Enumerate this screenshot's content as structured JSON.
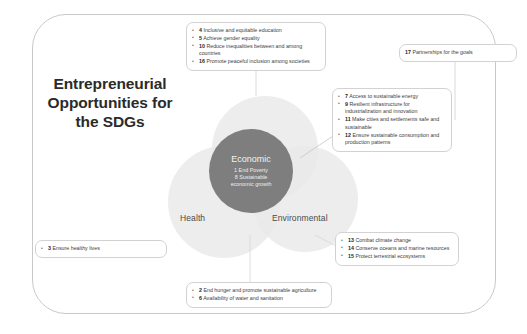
{
  "title": "Entrepreneurial Opportunities for the SDGs",
  "colors": {
    "core_circle": "#7e7e7e",
    "venn_circle": "#e9e9e9",
    "frame_border": "#c9c9c9",
    "callout_border": "#d2d2d2",
    "title_text": "#2b2b2b"
  },
  "venn": {
    "social_label": "Social",
    "health_label": "Health",
    "environmental_label": "Environmental",
    "core": {
      "title": "Economic",
      "line1": "1 End Poverty",
      "line2": "8 Sustainable",
      "line3": "economic growth"
    }
  },
  "callouts": {
    "social": [
      {
        "num": "4",
        "text": "Inclusive and equitable education"
      },
      {
        "num": "5",
        "text": "Achieve gender equality"
      },
      {
        "num": "10",
        "text": "Reduce inequalities between and among countries"
      },
      {
        "num": "16",
        "text": "Promote peaceful inclusion among societies"
      }
    ],
    "partnerships": [
      {
        "num": "17",
        "text": "Partnerships for the goals"
      }
    ],
    "economic_right": [
      {
        "num": "7",
        "text": "Access to sustainable energy"
      },
      {
        "num": "9",
        "text": "Resilient infrastructure for industrialization and innovation"
      },
      {
        "num": "11",
        "text": "Make cities and settlements safe and sustainable"
      },
      {
        "num": "12",
        "text": "Ensure sustainable consumption and production patterns"
      }
    ],
    "environmental": [
      {
        "num": "13",
        "text": "Combat climate change"
      },
      {
        "num": "14",
        "text": "Conserve oceans and marine resources"
      },
      {
        "num": "15",
        "text": "Protect terrestrial ecosystems"
      }
    ],
    "bottom": [
      {
        "num": "2",
        "text": "End hunger and promote sustainable agriculture"
      },
      {
        "num": "6",
        "text": "Availability of water and sanitation"
      }
    ],
    "health": [
      {
        "num": "3",
        "text": "Ensure healthy lives"
      }
    ]
  }
}
